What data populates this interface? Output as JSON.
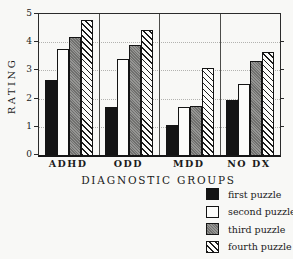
{
  "figure_title": "",
  "chart_data": {
    "type": "bar",
    "categories": [
      "ADHD",
      "ODD",
      "MDD",
      "NO DX"
    ],
    "series": [
      {
        "name": "first puzzle",
        "pattern": "solid-black",
        "values": [
          2.65,
          1.7,
          1.05,
          1.95
        ]
      },
      {
        "name": "second puzzle",
        "pattern": "white-outline",
        "values": [
          3.75,
          3.4,
          1.7,
          2.5
        ]
      },
      {
        "name": "third puzzle",
        "pattern": "halftone-gray",
        "values": [
          4.2,
          3.9,
          1.75,
          3.35
        ]
      },
      {
        "name": "fourth puzzle",
        "pattern": "diagonal-hatch",
        "values": [
          4.8,
          4.45,
          3.1,
          3.65
        ]
      }
    ],
    "title": "",
    "xlabel": "DIAGNOSTIC GROUPS",
    "ylabel": "RATING",
    "ylim": [
      0,
      5
    ],
    "yticks": [
      0,
      1,
      2,
      3,
      4,
      5
    ],
    "right_ticks": [
      1,
      2,
      3,
      4
    ],
    "gridlines_at": [
      1,
      2,
      3,
      4
    ],
    "grid": "horizontal-dotted",
    "legend_position": "bottom-right",
    "colors": {
      "bar_black": "#141414",
      "bar_white": "#fcfcfa",
      "bar_gray": "#8f8f8d",
      "hatch_line": "#1c1c1c",
      "paper": "#f8f8f6",
      "axis": "#2b2b2b",
      "gridline": "#b3b3b0"
    }
  }
}
